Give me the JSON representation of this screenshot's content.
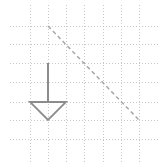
{
  "canvas": {
    "width": 166,
    "height": 167,
    "background": "#ffffff"
  },
  "grid": {
    "color": "#c8c8c8",
    "vertical_x": [
      30,
      48,
      66,
      84,
      103,
      121,
      139
    ],
    "horizontal_y": [
      26,
      44,
      63,
      82,
      102,
      120,
      139
    ],
    "x_extent": [
      10,
      160
    ],
    "y_extent": [
      5,
      162
    ]
  },
  "dashed_line": {
    "x1": 48,
    "y1": 26,
    "x2": 139,
    "y2": 120,
    "color": "#a8a8a8"
  },
  "arrow": {
    "color": "#8c8c8c",
    "shaft": {
      "x": 48,
      "y1": 63,
      "y2": 102
    },
    "head": {
      "left": [
        30,
        102
      ],
      "right": [
        66,
        102
      ],
      "tip": [
        48,
        120
      ]
    }
  }
}
